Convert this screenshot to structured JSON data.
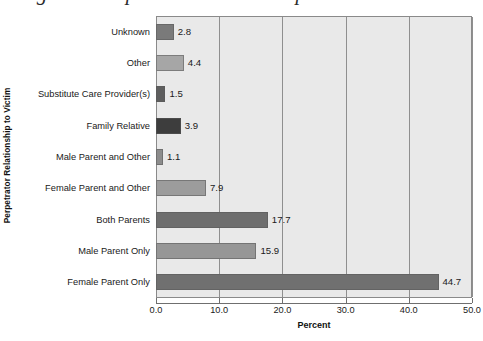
{
  "page": {
    "cutoff_title_fragment": "Figure 3  Perpetrator Relationship"
  },
  "chart_data": {
    "type": "bar",
    "orientation": "horizontal",
    "title": "",
    "xlabel": "Percent",
    "ylabel": "Perpetrator Relationship to Victim",
    "xlim": [
      0.0,
      50.0
    ],
    "xticks": [
      "0.0",
      "10.0",
      "20.0",
      "30.0",
      "40.0",
      "50.0"
    ],
    "xtick_values": [
      0,
      10,
      20,
      30,
      40,
      50
    ],
    "grid": "vertical",
    "legend": "none",
    "plot_background": "#e9e9e9",
    "categories": [
      "Unknown",
      "Other",
      "Substitute Care Provider(s)",
      "Family Relative",
      "Male Parent and Other",
      "Female Parent and Other",
      "Both Parents",
      "Male Parent Only",
      "Female Parent Only"
    ],
    "values": [
      2.8,
      4.4,
      1.5,
      3.9,
      1.1,
      7.9,
      17.7,
      15.9,
      44.7
    ],
    "value_labels": [
      "2.8",
      "4.4",
      "1.5",
      "3.9",
      "1.1",
      "7.9",
      "17.7",
      "15.9",
      "44.7"
    ],
    "bar_colors": [
      "#7a7a7a",
      "#a6a6a6",
      "#5e5e5e",
      "#3d3d3d",
      "#8c8c8c",
      "#9c9c9c",
      "#6e6e6e",
      "#969696",
      "#707070"
    ]
  }
}
